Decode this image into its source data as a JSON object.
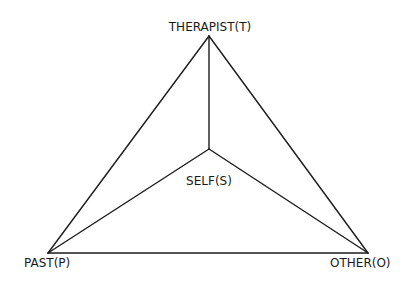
{
  "diagram": {
    "nodes": {
      "therapist": {
        "id": "T",
        "label": "THERAPIST(T)"
      },
      "past": {
        "id": "P",
        "label": "PAST(P)"
      },
      "other": {
        "id": "O",
        "label": "OTHER(O)"
      },
      "self": {
        "id": "S",
        "label": "SELF(S)"
      }
    },
    "edges": [
      {
        "from": "T",
        "to": "P"
      },
      {
        "from": "T",
        "to": "O"
      },
      {
        "from": "P",
        "to": "O"
      },
      {
        "from": "S",
        "to": "T"
      },
      {
        "from": "S",
        "to": "P"
      },
      {
        "from": "S",
        "to": "O"
      }
    ]
  }
}
